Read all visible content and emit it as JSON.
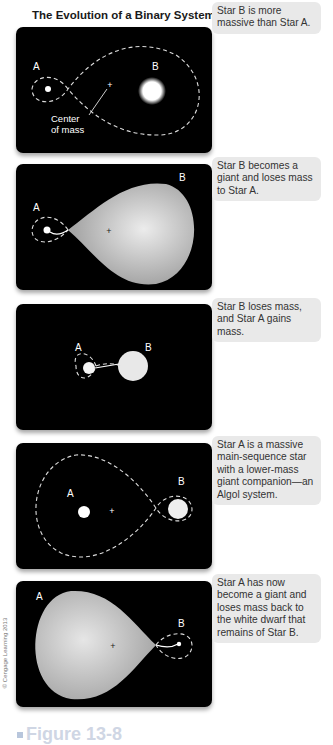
{
  "title": "The Evolution of a Binary System",
  "panels": [
    {
      "label_a": "A",
      "label_b": "B",
      "annotation": "Center\nof mass",
      "annotation_line1": "Center",
      "annotation_line2": "of mass",
      "callout": "Star B is more massive than Star A."
    },
    {
      "label_a": "A",
      "label_b": "B",
      "callout": "Star B becomes a giant and loses mass to Star A."
    },
    {
      "label_a": "A",
      "label_b": "B",
      "callout": "Star B loses mass, and Star A gains mass."
    },
    {
      "label_a": "A",
      "label_b": "B",
      "callout": "Star A is a massive main-sequence star with a lower-mass giant companion—an Algol system."
    },
    {
      "label_a": "A",
      "label_b": "B",
      "callout": "Star A has now become a giant and loses mass back to the white dwarf that remains of Star B."
    }
  ],
  "copyright": "© Cengage Learning 2013",
  "figure_caption": "Figure 13-8",
  "colors": {
    "panel_bg": "#000000",
    "callout_bg": "#e9e9e9",
    "star": "#ffffff",
    "giant": "#b5b5b5"
  }
}
